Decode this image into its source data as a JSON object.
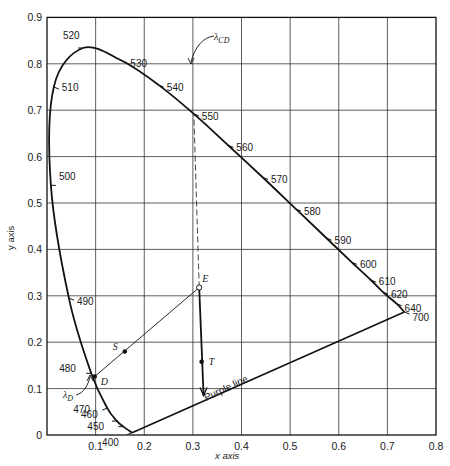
{
  "chart_data": {
    "type": "line",
    "title": "",
    "xlabel": "x axis",
    "ylabel": "y axis",
    "xlim": [
      0,
      0.8
    ],
    "ylim": [
      0,
      0.9
    ],
    "grid": true,
    "x_ticks": [
      "0.1",
      "0.2",
      "0.3",
      "0.4",
      "0.5",
      "0.6",
      "0.7",
      "0.8"
    ],
    "y_ticks": [
      "0",
      "0.1",
      "0.2",
      "0.3",
      "0.4",
      "0.5",
      "0.6",
      "0.7",
      "0.8",
      "0.9"
    ],
    "spectral_locus": [
      {
        "nm": 400,
        "x": 0.175,
        "y": 0.005
      },
      {
        "nm": 450,
        "x": 0.157,
        "y": 0.018
      },
      {
        "nm": 460,
        "x": 0.144,
        "y": 0.03
      },
      {
        "nm": 470,
        "x": 0.124,
        "y": 0.058
      },
      {
        "nm": 480,
        "x": 0.091,
        "y": 0.133
      },
      {
        "nm": 490,
        "x": 0.045,
        "y": 0.295
      },
      {
        "nm": 500,
        "x": 0.008,
        "y": 0.538
      },
      {
        "nm": 510,
        "x": 0.014,
        "y": 0.75
      },
      {
        "nm": 520,
        "x": 0.074,
        "y": 0.834
      },
      {
        "nm": 530,
        "x": 0.155,
        "y": 0.806
      },
      {
        "nm": 540,
        "x": 0.23,
        "y": 0.754
      },
      {
        "nm": 550,
        "x": 0.302,
        "y": 0.692
      },
      {
        "nm": 560,
        "x": 0.373,
        "y": 0.624
      },
      {
        "nm": 570,
        "x": 0.444,
        "y": 0.555
      },
      {
        "nm": 580,
        "x": 0.512,
        "y": 0.487
      },
      {
        "nm": 590,
        "x": 0.575,
        "y": 0.424
      },
      {
        "nm": 600,
        "x": 0.627,
        "y": 0.372
      },
      {
        "nm": 610,
        "x": 0.666,
        "y": 0.334
      },
      {
        "nm": 620,
        "x": 0.691,
        "y": 0.308
      },
      {
        "nm": 640,
        "x": 0.719,
        "y": 0.283
      },
      {
        "nm": 700,
        "x": 0.735,
        "y": 0.265
      }
    ],
    "wavelength_labels": [
      "400",
      "450",
      "460",
      "470",
      "480",
      "490",
      "500",
      "510",
      "520",
      "530",
      "540",
      "550",
      "560",
      "570",
      "580",
      "590",
      "600",
      "610",
      "620",
      "640",
      "700"
    ],
    "points": [
      {
        "label": "E",
        "x": 0.313,
        "y": 0.318,
        "style": "open-circle"
      },
      {
        "label": "S",
        "x": 0.16,
        "y": 0.18,
        "style": "dot"
      },
      {
        "label": "D",
        "x": 0.098,
        "y": 0.126,
        "style": "dot"
      },
      {
        "label": "T",
        "x": 0.318,
        "y": 0.158,
        "style": "dot"
      }
    ],
    "lines": [
      {
        "name": "E to D line",
        "from": "E",
        "to": "D",
        "style": "solid-thin"
      },
      {
        "name": "E to lambda_CD",
        "from": [
          0.313,
          0.318
        ],
        "to": [
          0.302,
          0.692
        ],
        "style": "dashed"
      },
      {
        "name": "E through T arrow",
        "from": [
          0.313,
          0.318
        ],
        "to": [
          0.322,
          0.085
        ],
        "style": "solid-thick-arrow"
      },
      {
        "name": "Purple line",
        "from": [
          0.175,
          0.005
        ],
        "to": [
          0.735,
          0.265
        ],
        "style": "solid"
      }
    ],
    "annotations": [
      {
        "text": "λCD",
        "main": "λ",
        "sub": "CD",
        "points_to": 550
      },
      {
        "text": "λD",
        "main": "λ",
        "sub": "D",
        "points_to": "D"
      },
      {
        "text": "Purple line"
      }
    ]
  }
}
